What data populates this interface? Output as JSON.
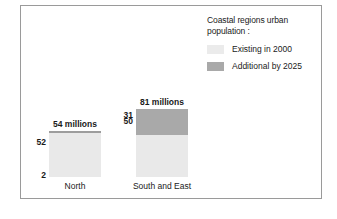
{
  "legend": {
    "title": "Coastal regions urban\npopulation :",
    "items": [
      {
        "label": "Existing in 2000",
        "color": "#ebebeb",
        "swatch_name": "legend-swatch-existing"
      },
      {
        "label": "Additional by 2025",
        "color": "#a9a9a9",
        "swatch_name": "legend-swatch-additional"
      }
    ]
  },
  "chart_data": {
    "type": "bar",
    "subtype": "stacked",
    "title": "",
    "xlabel": "",
    "ylabel": "",
    "unit": "millions",
    "categories": [
      "North",
      "South and East"
    ],
    "series": [
      {
        "name": "Existing in 2000",
        "color": "#e9e9e9",
        "values": [
          52,
          50
        ]
      },
      {
        "name": "Additional by 2025",
        "color": "#a9a9a9",
        "values": [
          2,
          31
        ]
      }
    ],
    "totals": [
      54,
      81
    ],
    "total_labels": [
      "54 millions",
      "81 millions"
    ],
    "segment_labels": {
      "existing": [
        "52",
        "50"
      ],
      "additional": [
        "2",
        "31"
      ]
    },
    "legend_position": "top-right",
    "grid": false,
    "axis_visible": false,
    "ylim": [
      0,
      81
    ]
  },
  "bars": [
    {
      "category": "North",
      "total_label": "54 millions",
      "existing_label": "52",
      "additional_label": "2",
      "existing_px": 44,
      "additional_px": 2
    },
    {
      "category": "South and East",
      "total_label": "81 millions",
      "existing_label": "50",
      "additional_label": "31",
      "existing_px": 42,
      "additional_px": 26
    }
  ]
}
